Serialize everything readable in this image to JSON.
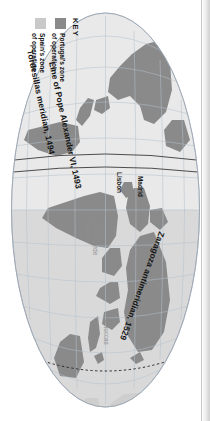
{
  "figure": {
    "type": "map",
    "projection": "mollweide-oval",
    "orientation": "rotated-90-clockwise"
  },
  "colors": {
    "portugal_zone": "#8a8a8a",
    "spain_zone": "#c9c9c9",
    "land": "#8a8a8a",
    "land_light": "#d6d6d6",
    "graticule": "#b9c4cf",
    "ocean": "#fbfbfb",
    "text": "#111111",
    "text_light": "#8e8e8e"
  },
  "legend": {
    "title": "KEY",
    "items": [
      {
        "swatch": "#8a8a8a",
        "line1": "Portugal's zone",
        "line2": "of operation"
      },
      {
        "swatch": "#c9c9c9",
        "line1": "Spain's zone",
        "line2": "of operation"
      }
    ]
  },
  "map_labels": {
    "meridians": [
      {
        "name": "zaragoza-antimeridian",
        "text": "Zaragoza antimeridian, 1529"
      },
      {
        "name": "pope-alexander-line",
        "text": "Line of Pope Alexander VI, 1493"
      },
      {
        "name": "tordesillas-meridian",
        "text": "Tordesillas meridian, 1494"
      }
    ],
    "places": [
      {
        "name": "madrid",
        "text": "Madrid",
        "style": "dark"
      },
      {
        "name": "lisbon",
        "text": "Lisbon",
        "style": "dark"
      },
      {
        "name": "cape-verde-islands",
        "line1": "Cape Verde",
        "line2": "Islands",
        "style": "light"
      },
      {
        "name": "moluccas",
        "text": "Moluccas",
        "style": "light"
      }
    ]
  }
}
